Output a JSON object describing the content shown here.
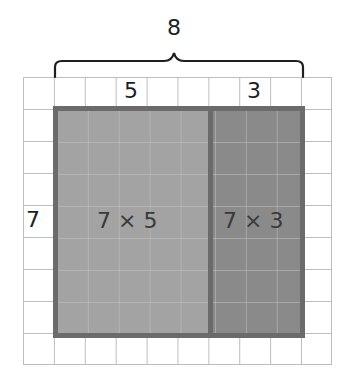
{
  "diagram": {
    "type": "area-model",
    "total_width_label": "8",
    "part_width_labels": [
      "5",
      "3"
    ],
    "height_label": "7",
    "region_labels": [
      "7 × 5",
      "7 × 3"
    ],
    "grid": {
      "columns": 10,
      "rows": 9
    },
    "colors": {
      "left_region": "#a3a3a3",
      "right_region": "#8a8a8a",
      "border": "#6b6b6b",
      "grid_line": "#bdbdbd",
      "brace": "#1e1e1e"
    }
  }
}
